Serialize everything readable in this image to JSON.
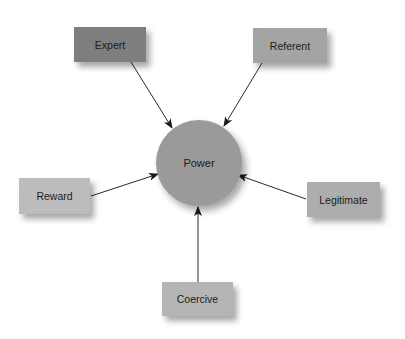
{
  "diagram": {
    "center": {
      "label": "Power",
      "cx": 199,
      "cy": 163,
      "r": 43,
      "color": "#9a9a9a"
    },
    "nodes": [
      {
        "id": "expert",
        "label": "Expert",
        "x": 74,
        "y": 27,
        "w": 72,
        "h": 35,
        "color": "#7e7e7e"
      },
      {
        "id": "referent",
        "label": "Referent",
        "x": 253,
        "y": 28,
        "w": 74,
        "h": 35,
        "color": "#a4a4a4"
      },
      {
        "id": "reward",
        "label": "Reward",
        "x": 19,
        "y": 178,
        "w": 71,
        "h": 36,
        "color": "#bcbcbc"
      },
      {
        "id": "legitimate",
        "label": "Legitimate",
        "x": 307,
        "y": 182,
        "w": 73,
        "h": 35,
        "color": "#adadad"
      },
      {
        "id": "coercive",
        "label": "Coercive",
        "x": 162,
        "y": 282,
        "w": 71,
        "h": 34,
        "color": "#b5b5b5"
      }
    ],
    "edges": [
      {
        "from": "expert",
        "to": "power",
        "x1": 131,
        "y1": 62,
        "x2": 172,
        "y2": 128
      },
      {
        "from": "referent",
        "to": "power",
        "x1": 262,
        "y1": 63,
        "x2": 224,
        "y2": 126
      },
      {
        "from": "reward",
        "to": "power",
        "x1": 91,
        "y1": 196,
        "x2": 158,
        "y2": 174
      },
      {
        "from": "legitimate",
        "to": "power",
        "x1": 306,
        "y1": 199,
        "x2": 238,
        "y2": 175
      },
      {
        "from": "coercive",
        "to": "power",
        "x1": 198,
        "y1": 282,
        "x2": 198,
        "y2": 207
      }
    ],
    "edge_color": "#2a2a2a"
  }
}
